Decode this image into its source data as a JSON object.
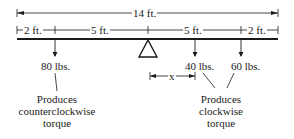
{
  "diagram": {
    "total_length": "14 ft.",
    "segments": [
      "2 ft.",
      "5 ft.",
      "5 ft.",
      "2 ft."
    ],
    "forces": [
      {
        "label": "80 lbs."
      },
      {
        "label": "40 lbs."
      },
      {
        "label": "60 lbs."
      }
    ],
    "x_label": "x",
    "captions": {
      "left": [
        "Produces",
        "counterclockwise",
        "torque"
      ],
      "right": [
        "Produces",
        "clockwise",
        "torque"
      ]
    },
    "colors": {
      "ink": "#1a1a1a",
      "background": "#ffffff"
    }
  }
}
